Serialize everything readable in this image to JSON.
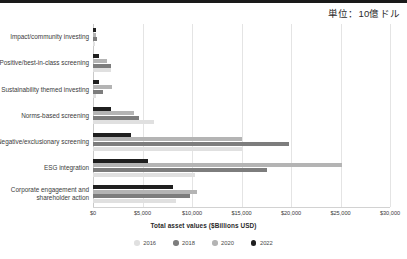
{
  "top_strip": {
    "color": "#1a1a1a"
  },
  "unit_note": "単位：10億ドル",
  "chart_data": {
    "type": "bar",
    "orientation": "horizontal",
    "title": "",
    "subtitle": "",
    "xlabel": "Total asset values ($Billions USD)",
    "ylabel": "",
    "xlim": [
      0,
      30000
    ],
    "xticks": [
      0,
      5000,
      10000,
      15000,
      20000,
      25000,
      30000
    ],
    "xtick_labels": [
      "$0",
      "$5,000",
      "$10,000",
      "$15,000",
      "$20,000",
      "$25,000",
      "$30,000"
    ],
    "grid": true,
    "grid_axis": "x",
    "legend_position": "bottom",
    "categories": [
      "Impact/community investing",
      "Positive/best-in-class screening",
      "Sustainability themed investing",
      "Norms-based screening",
      "Negative/exclusionary screening",
      "ESG integration",
      "Corporate engagement and\nshareholder action"
    ],
    "series": [
      {
        "name": "2016",
        "color": "#e0e0e0",
        "values": [
          248,
          1842,
          276,
          6195,
          15064,
          10353,
          8385
        ]
      },
      {
        "name": "2018",
        "color": "#7d7d7d",
        "values": [
          444,
          1842,
          1018,
          4679,
          19771,
          17544,
          9835
        ]
      },
      {
        "name": "2020",
        "color": "#b4b4b4",
        "values": [
          352,
          1384,
          1948,
          4140,
          15030,
          25195,
          10504
        ]
      },
      {
        "name": "2022",
        "color": "#1f1f1f",
        "values": [
          275,
          574,
          572,
          1787,
          3837,
          5588,
          8032
        ]
      }
    ]
  }
}
